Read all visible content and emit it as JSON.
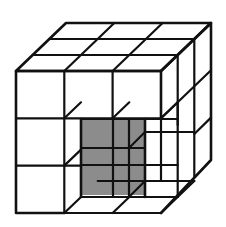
{
  "diagram": {
    "title": "3x3x3 cube with corner removed",
    "grid_size": 3,
    "removed_block": "2x2x2 front-bottom-right",
    "colors": {
      "line": "#111111",
      "shaded_face": "#8c8c8c",
      "background": "#ffffff"
    }
  }
}
